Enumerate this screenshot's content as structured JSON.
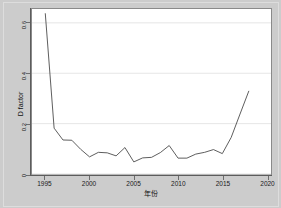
{
  "figure": {
    "background_color": "#cccccc",
    "plot_background_color": "#ffffff",
    "frame_color": "#8a8a8a",
    "line_color": "#4a4a4a",
    "grid_color": "#e6e6e6"
  },
  "chart_data": {
    "type": "line",
    "title": "",
    "xlabel": "年份",
    "ylabel": "D factor",
    "xlim": [
      1993.5,
      2020.5
    ],
    "ylim": [
      0,
      0.655
    ],
    "grid": true,
    "legend": null,
    "xticks": [
      1995,
      2000,
      2005,
      2010,
      2015,
      2020
    ],
    "xtick_labels": [
      "1995",
      "2000",
      "2005",
      "2010",
      "2015",
      "2020"
    ],
    "yticks": [
      0,
      0.2,
      0.4,
      0.6
    ],
    "ytick_labels": [
      "0",
      "0.2",
      "0.4",
      "0.6"
    ],
    "x": [
      1995,
      1996,
      1997,
      1998,
      1999,
      2000,
      2001,
      2002,
      2003,
      2004,
      2005,
      2006,
      2007,
      2008,
      2009,
      2010,
      2011,
      2012,
      2013,
      2014,
      2015,
      2016,
      2017,
      2018
    ],
    "values": [
      0.638,
      0.182,
      0.135,
      0.134,
      0.098,
      0.068,
      0.086,
      0.084,
      0.072,
      0.105,
      0.048,
      0.064,
      0.066,
      0.085,
      0.113,
      0.063,
      0.063,
      0.079,
      0.086,
      0.097,
      0.081,
      0.145,
      0.238,
      0.33
    ],
    "series_name": "D factor"
  }
}
